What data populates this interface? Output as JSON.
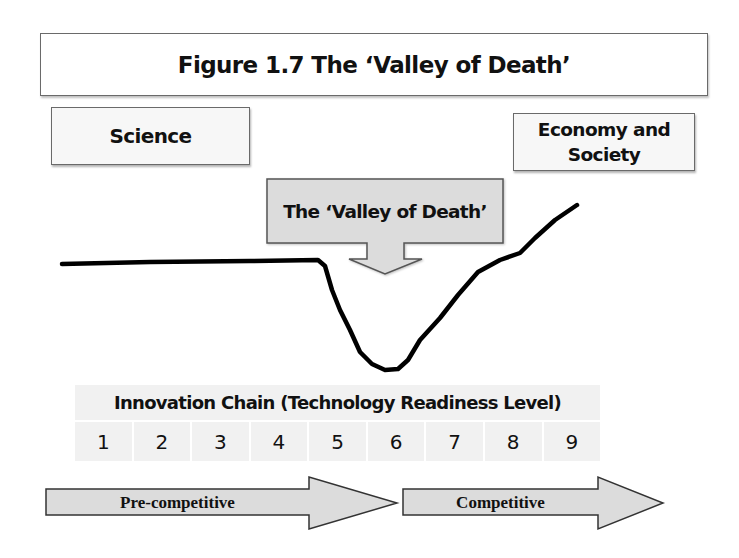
{
  "figure": {
    "title": "Figure 1.7 The ‘Valley of Death’"
  },
  "boxes": {
    "science": "Science",
    "economy_line1": "Economy and",
    "economy_line2": "Society"
  },
  "callout": {
    "label": "The ‘Valley of Death’",
    "fill": "#dcdcdc",
    "border": "#555555"
  },
  "curve": {
    "description": "Flat line from Science, dropping into a valley after TRL 5, bottoming near TRL 6, and rising toward Economy and Society",
    "color": "#000000",
    "points": [
      [
        62,
        264
      ],
      [
        150,
        262
      ],
      [
        250,
        261
      ],
      [
        318,
        260
      ],
      [
        325,
        266
      ],
      [
        332,
        290
      ],
      [
        340,
        310
      ],
      [
        350,
        330
      ],
      [
        360,
        352
      ],
      [
        372,
        364
      ],
      [
        385,
        370
      ],
      [
        398,
        369
      ],
      [
        408,
        360
      ],
      [
        420,
        340
      ],
      [
        440,
        318
      ],
      [
        458,
        295
      ],
      [
        478,
        272
      ],
      [
        500,
        260
      ],
      [
        520,
        253
      ],
      [
        535,
        238
      ],
      [
        555,
        220
      ],
      [
        577,
        205
      ]
    ]
  },
  "innovation_chain": {
    "header": "Innovation Chain (Technology Readiness Level)",
    "levels": [
      "1",
      "2",
      "3",
      "4",
      "5",
      "6",
      "7",
      "8",
      "9"
    ],
    "cell_fill": "#f1f1f1"
  },
  "phases": [
    {
      "label": "Pre-competitive",
      "fill": "#dcdcdc"
    },
    {
      "label": "Competitive",
      "fill": "#dcdcdc"
    }
  ]
}
